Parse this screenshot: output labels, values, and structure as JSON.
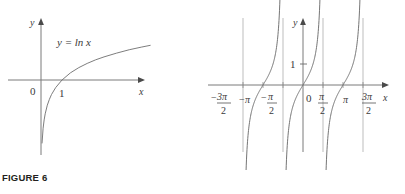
{
  "figures": [
    {
      "id": "figure-6",
      "caption": "FIGURE 6",
      "curve_label": "y = ln x",
      "axis_x_label": "x",
      "axis_y_label": "y",
      "tick_labels": [
        "0",
        "1"
      ],
      "description": "Graph of the natural logarithm function",
      "chart_data": {
        "type": "line",
        "title": "y = ln x",
        "xlabel": "x",
        "ylabel": "y",
        "xlim": [
          0,
          5.2
        ],
        "ylim": [
          -3.2,
          1.8
        ],
        "grid": false,
        "legend": "none",
        "annotations": [
          "y = ln x"
        ],
        "xticks": [
          0,
          1
        ],
        "xticklabels": [
          "0",
          "1"
        ],
        "series": [
          {
            "name": "ln x",
            "x": [
              0.05,
              0.1,
              0.15,
              0.2,
              0.3,
              0.4,
              0.5,
              0.7,
              1.0,
              1.4,
              1.8,
              2.2,
              2.6,
              3.0,
              3.6,
              4.2,
              4.8,
              5.2
            ],
            "y": [
              -3.0,
              -2.3,
              -1.9,
              -1.61,
              -1.2,
              -0.92,
              -0.69,
              -0.36,
              0.0,
              0.34,
              0.59,
              0.79,
              0.96,
              1.1,
              1.28,
              1.44,
              1.57,
              1.65
            ]
          }
        ]
      }
    },
    {
      "id": "figure-7",
      "caption": "FIGURE 7",
      "axis_x_label": "x",
      "axis_y_label": "y",
      "y_tick_label": "1",
      "x_tick_labels": [
        "-3π/2",
        "-π",
        "-π/2",
        "0",
        "π/2",
        "π",
        "3π/2"
      ],
      "description": "Graph of the tangent function with vertical asymptotes",
      "chart_data": {
        "type": "line",
        "title": "y = tan x",
        "xlabel": "x",
        "ylabel": "y",
        "xlim": [
          -5.3,
          5.3
        ],
        "ylim": [
          -6.0,
          6.0
        ],
        "grid": false,
        "legend": "none",
        "xticks": [
          -4.712,
          -3.1416,
          -1.5708,
          0,
          1.5708,
          3.1416,
          4.712
        ],
        "xticklabels": [
          "-3π/2",
          "-π",
          "-π/2",
          "0",
          "π/2",
          "π",
          "3π/2"
        ],
        "yticks": [
          1
        ],
        "yticklabels": [
          "1"
        ],
        "asymptotes": [
          -4.712,
          -1.5708,
          1.5708,
          4.712
        ],
        "branches": [
          {
            "name": "branch -2",
            "x_range": [
              -4.712,
              -1.5708
            ]
          },
          {
            "name": "branch -1",
            "x_range": [
              -1.5708,
              1.5708
            ]
          },
          {
            "name": "branch 1",
            "x_range": [
              1.5708,
              4.712
            ]
          }
        ]
      }
    }
  ],
  "colors": {
    "curve": "#6e6e6e",
    "axis": "#7a7a7a",
    "asymptote": "#b6b6b6",
    "text": "#3a3a3a",
    "caption": "#231f20",
    "background": "#ffffff"
  }
}
